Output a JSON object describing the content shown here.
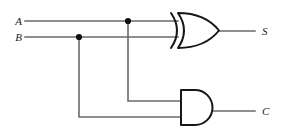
{
  "diagram": {
    "type": "logic-circuit",
    "colors": {
      "background": "#ffffff",
      "wire": "#6a6a6a",
      "gate_outline": "#17171a",
      "junction": "#111114",
      "label": "#1c1c1f"
    },
    "inputs": [
      {
        "id": "A",
        "label": "A",
        "x": 18,
        "y": 21
      },
      {
        "id": "B",
        "label": "B",
        "x": 18,
        "y": 37
      }
    ],
    "outputs": [
      {
        "id": "S",
        "label": "S",
        "x": 262,
        "y": 31
      },
      {
        "id": "C",
        "label": "C",
        "x": 262,
        "y": 111
      }
    ],
    "gates": [
      {
        "id": "xor1",
        "type": "XOR",
        "name": "xor-gate",
        "output": "S",
        "inputs": [
          "A",
          "B"
        ],
        "x": 172,
        "y": 13,
        "width": 47,
        "height": 35
      },
      {
        "id": "and1",
        "type": "AND",
        "name": "and-gate",
        "output": "C",
        "inputs": [
          "A",
          "B"
        ],
        "x": 181,
        "y": 90,
        "width": 31,
        "height": 35
      }
    ],
    "junctions": [
      {
        "id": "j-a",
        "on": "A",
        "x": 128,
        "y": 21
      },
      {
        "id": "j-b",
        "on": "B",
        "x": 79,
        "y": 37
      }
    ],
    "wires": [
      {
        "id": "w-a-main",
        "from": "A",
        "to": "xor1.in0",
        "path": "M25,21 L178,21"
      },
      {
        "id": "w-b-main",
        "from": "B",
        "to": "xor1.in1",
        "path": "M25,37 L178,37"
      },
      {
        "id": "w-a-branch",
        "from": "j-a",
        "to": "and1.in0",
        "path": "M128,21 L128,101 L181,101"
      },
      {
        "id": "w-b-branch",
        "from": "j-b",
        "to": "and1.in1",
        "path": "M79,37 L79,117 L181,117"
      },
      {
        "id": "w-s-out",
        "from": "xor1",
        "to": "S",
        "path": "M219,31 L255,31"
      },
      {
        "id": "w-c-out",
        "from": "and1",
        "to": "C",
        "path": "M212,111 L255,111"
      }
    ]
  }
}
